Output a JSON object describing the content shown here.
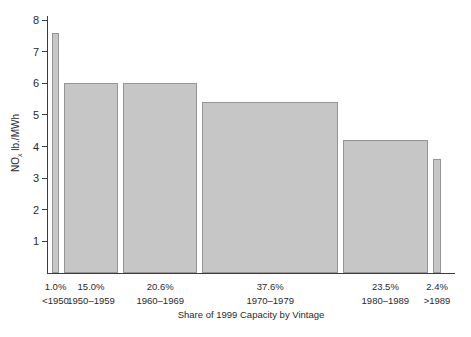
{
  "chart_data": {
    "type": "bar",
    "xlabel": "Share of 1999 Capacity by Vintage",
    "ylabel": "NOx lb./MWh",
    "ylabel_parts": {
      "prefix": "NO",
      "sub": "x",
      "suffix": " lb./MWh"
    },
    "ylim": [
      0,
      8
    ],
    "yticks": [
      1,
      2,
      3,
      4,
      5,
      6,
      7,
      8
    ],
    "grid": false,
    "legend": "none",
    "bar_width_mode": "proportional-to-capacity-share",
    "categories": [
      "<1950",
      "1950–1959",
      "1960–1969",
      "1970–1979",
      "1980–1989",
      ">1989"
    ],
    "share_labels": [
      "1.0%",
      "15.0%",
      "20.6%",
      "37.6%",
      "23.5%",
      "2.4%"
    ],
    "shares_percent": [
      1.0,
      15.0,
      20.6,
      37.6,
      23.5,
      2.4
    ],
    "values": [
      7.6,
      6.0,
      6.0,
      5.4,
      4.2,
      3.6
    ],
    "colors": {
      "bar_fill": "#c6c6c6",
      "bar_border": "#959595",
      "axis": "#3c3c3c",
      "text": "#2a2a2a",
      "background": "#ffffff"
    }
  }
}
